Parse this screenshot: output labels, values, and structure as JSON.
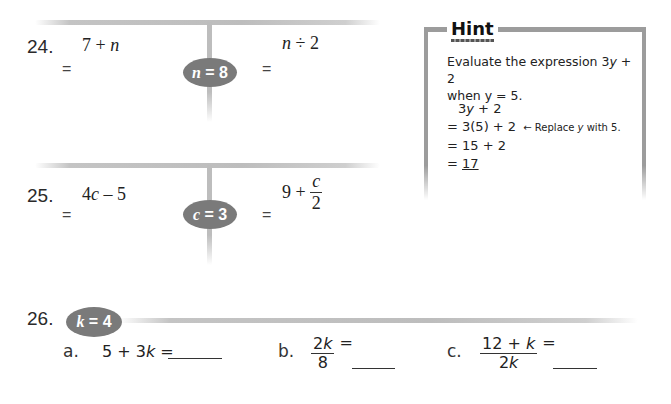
{
  "problems": [
    {
      "number": "24.",
      "variable_badge": {
        "var": "n",
        "op": " = ",
        "value": "8"
      },
      "left_expr": {
        "a": "7 + ",
        "var": "n"
      },
      "right_expr": {
        "var": "n",
        "rest": " ÷ 2"
      },
      "equals_left": "=",
      "equals_right": "="
    },
    {
      "number": "25.",
      "variable_badge": {
        "var": "c",
        "op": " = ",
        "value": "3"
      },
      "left_expr": {
        "a": "4",
        "var": "c",
        "rest": " – 5"
      },
      "right_expr": {
        "a": "9 + ",
        "frac_top": "c",
        "frac_bot": "2"
      },
      "equals_left": "=",
      "equals_right": "="
    },
    {
      "number": "26.",
      "variable_badge": {
        "var": "k",
        "op": " = ",
        "value": "4"
      },
      "parts": [
        {
          "label": "a.",
          "expr_pre": "5 + 3",
          "var": "k",
          "expr_post": " ="
        },
        {
          "label": "b.",
          "frac_top_pre": "2",
          "frac_top_var": "k",
          "frac_bot": "8",
          "equals": "="
        },
        {
          "label": "c.",
          "frac_top_pre": "12 + ",
          "frac_top_var": "k",
          "frac_bot_pre": "2",
          "frac_bot_var": "k",
          "equals": "="
        }
      ]
    }
  ],
  "hint": {
    "title": "Hint",
    "intro_1": "Evaluate the expression 3",
    "intro_var": "y",
    "intro_2": " + 2",
    "intro_line2": "when y = 5.",
    "steps": [
      {
        "pre": "3",
        "var": "y",
        "post": " + 2"
      },
      {
        "text": "= 3(5) + 2"
      },
      {
        "text": "= 15 + 2"
      },
      {
        "eq": "= ",
        "answer": "17"
      }
    ],
    "note_arrow": "←",
    "note_pre": "Replace ",
    "note_var": "y",
    "note_post": " with 5."
  },
  "colors": {
    "badge": "#7a7a7a",
    "divider": "#bdbdbd",
    "hint_border": "#9c9c9c"
  }
}
